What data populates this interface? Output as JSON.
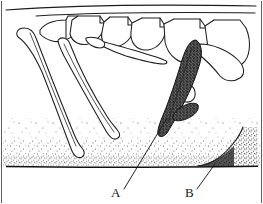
{
  "figure": {
    "kind": "scientific-line-drawing",
    "technique": "pen-and-ink stipple",
    "background_color": "#ffffff",
    "ink_color": "#1d1d1d",
    "stipple_color": "#2a2a2a",
    "shaded_element_color": "#4a4a4a",
    "width_px": 263,
    "height_px": 204,
    "labels": [
      {
        "id": "A",
        "text": "A",
        "x": 113,
        "y": 196,
        "leader_from_x": 124,
        "leader_from_y": 189,
        "leader_to_x": 167,
        "leader_to_y": 118,
        "points_to": "tip of dark shaded pelvic element"
      },
      {
        "id": "B",
        "text": "B",
        "x": 187,
        "y": 196,
        "leader_from_x": 197,
        "leader_from_y": 189,
        "leader_to_x": 215,
        "leader_to_y": 165,
        "points_to": "rising curved sediment surface at right"
      }
    ],
    "elements": [
      {
        "name": "dorsal-body-outline",
        "type": "long-horizontal-curve",
        "y_start": 10,
        "y_end": 7
      },
      {
        "name": "vertebral-column",
        "type": "series-of-vertebrae",
        "count": 5
      },
      {
        "name": "rib-left-outer",
        "type": "curved-rib"
      },
      {
        "name": "rib-left-inner",
        "type": "curved-rib"
      },
      {
        "name": "rib-middle",
        "type": "curved-rib"
      },
      {
        "name": "pelvic-element-dark",
        "type": "shaded-bone"
      },
      {
        "name": "sediment-bed",
        "type": "stipple-field"
      },
      {
        "name": "ground-baseline",
        "type": "solid-horizontal-line",
        "y": 166
      },
      {
        "name": "sediment-rise-right",
        "type": "curved-line"
      }
    ]
  }
}
